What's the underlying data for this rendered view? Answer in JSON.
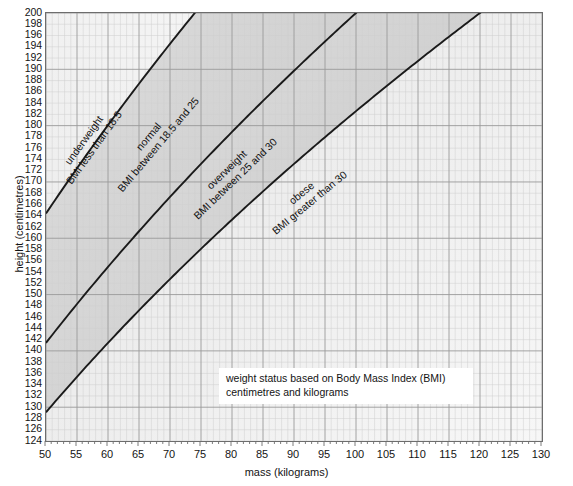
{
  "chart_data": {
    "type": "line",
    "title": "weight status based on Body Mass Index (BMI)",
    "subtitle": "centimetres and kilograms",
    "xlabel": "mass (kilograms)",
    "ylabel": "height (centimetres)",
    "xlim": [
      50,
      130
    ],
    "ylim": [
      124,
      200
    ],
    "x_major_step": 5,
    "x_minor_step": 1,
    "y_major_step": 2,
    "grid": true,
    "legend_position": "inline-band-labels",
    "x_tick_labels": [
      "50",
      "55",
      "60",
      "65",
      "70",
      "75",
      "80",
      "85",
      "90",
      "95",
      "100",
      "105",
      "110",
      "115",
      "120",
      "125",
      "130"
    ],
    "y_tick_labels": [
      "124",
      "126",
      "128",
      "130",
      "132",
      "134",
      "136",
      "138",
      "140",
      "142",
      "144",
      "146",
      "148",
      "150",
      "152",
      "154",
      "156",
      "158",
      "160",
      "162",
      "164",
      "166",
      "168",
      "170",
      "172",
      "174",
      "176",
      "178",
      "180",
      "182",
      "184",
      "186",
      "188",
      "190",
      "192",
      "194",
      "196",
      "198",
      "200"
    ],
    "series": [
      {
        "name": "BMI 18.5 boundary",
        "formula": "height = 100 * sqrt(mass / 18.5)",
        "bmi": 18.5,
        "points": [
          {
            "x": 50,
            "y": 164.4
          },
          {
            "x": 55,
            "y": 172.4
          },
          {
            "x": 60,
            "y": 180.1
          },
          {
            "x": 65,
            "y": 187.4
          },
          {
            "x": 70,
            "y": 194.5
          },
          {
            "x": 73.99,
            "y": 200.0
          }
        ]
      },
      {
        "name": "BMI 25 boundary",
        "formula": "height = 100 * sqrt(mass / 25)",
        "bmi": 25,
        "points": [
          {
            "x": 50,
            "y": 141.4
          },
          {
            "x": 60,
            "y": 154.9
          },
          {
            "x": 70,
            "y": 167.3
          },
          {
            "x": 80,
            "y": 178.9
          },
          {
            "x": 90,
            "y": 189.7
          },
          {
            "x": 100,
            "y": 200.0
          }
        ]
      },
      {
        "name": "BMI 30 boundary",
        "formula": "height = 100 * sqrt(mass / 30)",
        "bmi": 30,
        "points": [
          {
            "x": 50,
            "y": 129.1
          },
          {
            "x": 60,
            "y": 141.4
          },
          {
            "x": 70,
            "y": 152.8
          },
          {
            "x": 80,
            "y": 163.3
          },
          {
            "x": 90,
            "y": 173.2
          },
          {
            "x": 100,
            "y": 182.6
          },
          {
            "x": 110,
            "y": 191.5
          },
          {
            "x": 120,
            "y": 200.0
          }
        ]
      }
    ],
    "bands": [
      {
        "key": "underweight",
        "label": "underweight",
        "sublabel": "BMI less than 18.5",
        "range": "BMI < 18.5"
      },
      {
        "key": "normal",
        "label": "normal",
        "sublabel": "BMI between 18.5 and 25",
        "range": "18.5 <= BMI < 25"
      },
      {
        "key": "overweight",
        "label": "overweight",
        "sublabel": "BMI between 25 and 30",
        "range": "25 <= BMI < 30"
      },
      {
        "key": "obese",
        "label": "obese",
        "sublabel": "BMI greater than 30",
        "range": "BMI > 30"
      }
    ]
  },
  "axes": {
    "y_title": "height (centimetres)",
    "x_title": "mass (kilograms)"
  },
  "caption": {
    "line1": "weight status based on Body Mass Index (BMI)",
    "line2": "centimetres and kilograms"
  },
  "band_labels": {
    "underweight_name": "underweight",
    "underweight_desc": "BMI less than 18.5",
    "normal_name": "normal",
    "normal_desc": "BMI between 18.5 and 25",
    "overweight_name": "overweight",
    "overweight_desc": "BMI between 25 and 30",
    "obese_name": "obese",
    "obese_desc": "BMI greater than 30"
  },
  "colors": {
    "line": "#1a1a1a",
    "frame": "#6d6d6d",
    "grid_major": "#9a9a9a",
    "grid_minor": "#cfcfcf",
    "text": "#141414",
    "shade_light": "#f2f2f2",
    "shade_mid": "#dcdcdc",
    "shade_dark": "#c9c9c9",
    "caption_bg": "#ffffff"
  }
}
